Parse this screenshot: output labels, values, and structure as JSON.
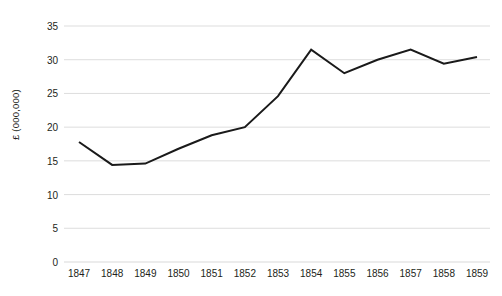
{
  "chart_data": {
    "type": "line",
    "title": "",
    "xlabel": "",
    "ylabel": "£ (000,000)",
    "categories": [
      "1847",
      "1848",
      "1849",
      "1850",
      "1851",
      "1852",
      "1853",
      "1854",
      "1855",
      "1856",
      "1857",
      "1858",
      "1859"
    ],
    "values": [
      17.8,
      14.4,
      14.6,
      16.8,
      18.8,
      20.0,
      24.6,
      31.5,
      28.0,
      30.0,
      31.5,
      29.4,
      30.4
    ],
    "series": [
      {
        "name": "",
        "values": [
          17.8,
          14.4,
          14.6,
          16.8,
          18.8,
          20.0,
          24.6,
          31.5,
          28.0,
          30.0,
          31.5,
          29.4,
          30.4
        ]
      }
    ],
    "ylim": [
      0,
      35
    ],
    "yticks": [
      0,
      5,
      10,
      15,
      20,
      25,
      30,
      35
    ],
    "ytick_labels": [
      "0",
      "5",
      "10",
      "15",
      "20",
      "25",
      "30",
      "35"
    ],
    "grid": true,
    "grid_axis": "y",
    "legend": false,
    "legend_position": "none",
    "line_color": "#1a1a1a",
    "grid_color": "#d9d9d9",
    "background_color": "#ffffff",
    "text_color": "#231f20"
  }
}
